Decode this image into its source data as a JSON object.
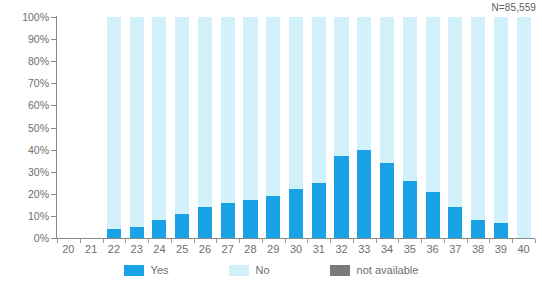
{
  "annotation": {
    "sample_size": "N=85,559"
  },
  "legend": {
    "position": "bottom-center",
    "items": [
      {
        "label": "Yes",
        "color": "#19a3e6",
        "key": "yes"
      },
      {
        "label": "No",
        "color": "#d2f1fb",
        "key": "no"
      },
      {
        "label": "not available",
        "color": "#7a7a7a",
        "key": "not_available"
      }
    ]
  },
  "axes": {
    "y": {
      "labels": [
        "100%",
        "90%",
        "80%",
        "70%",
        "60%",
        "50%",
        "40%",
        "30%",
        "20%",
        "10%",
        "0%"
      ],
      "min": 0,
      "max": 100,
      "step": 10,
      "unit": "%"
    },
    "x": {
      "labels": [
        "20",
        "21",
        "22",
        "23",
        "24",
        "25",
        "26",
        "27",
        "28",
        "29",
        "30",
        "31",
        "32",
        "33",
        "34",
        "35",
        "36",
        "37",
        "38",
        "39",
        "40"
      ]
    }
  },
  "chart_data": {
    "type": "bar",
    "stacked": true,
    "title": "",
    "subtitle": "",
    "xlabel": "",
    "ylabel": "",
    "ylim": [
      0,
      100
    ],
    "grid": false,
    "legend_position": "bottom",
    "annotations": [
      "N=85,559"
    ],
    "categories": [
      "20",
      "21",
      "22",
      "23",
      "24",
      "25",
      "26",
      "27",
      "28",
      "29",
      "30",
      "31",
      "32",
      "33",
      "34",
      "35",
      "36",
      "37",
      "38",
      "39",
      "40"
    ],
    "series": [
      {
        "name": "Yes",
        "color": "#19a3e6",
        "values": [
          0,
          0,
          4,
          5,
          8,
          11,
          14,
          16,
          17,
          19,
          22,
          25,
          37,
          40,
          34,
          26,
          21,
          14,
          8,
          7,
          0
        ]
      },
      {
        "name": "No",
        "color": "#d2f1fb",
        "values": [
          0,
          0,
          96,
          95,
          92,
          89,
          86,
          84,
          83,
          81,
          78,
          75,
          63,
          60,
          66,
          74,
          79,
          86,
          92,
          93,
          100
        ]
      },
      {
        "name": "not available",
        "color": "#7a7a7a",
        "values": [
          0,
          0,
          0,
          0,
          0,
          0,
          0,
          0,
          0,
          0,
          0,
          0,
          0,
          0,
          0,
          0,
          0,
          0,
          0,
          0,
          0
        ]
      }
    ],
    "empty_categories": [
      "20",
      "21"
    ]
  }
}
